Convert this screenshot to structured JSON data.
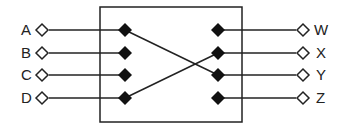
{
  "diagram": {
    "inputs": [
      {
        "label": "A",
        "y": 30
      },
      {
        "label": "B",
        "y": 53
      },
      {
        "label": "C",
        "y": 75
      },
      {
        "label": "D",
        "y": 98
      }
    ],
    "outputs": [
      {
        "label": "W",
        "y": 30
      },
      {
        "label": "X",
        "y": 53
      },
      {
        "label": "Y",
        "y": 75
      },
      {
        "label": "Z",
        "y": 98
      }
    ],
    "internal_connections": [
      {
        "from": "A",
        "to": "Y"
      },
      {
        "from": "D",
        "to": "X"
      }
    ],
    "colors": {
      "line": "#222222",
      "fill": "#111111",
      "background": "#ffffff"
    }
  }
}
